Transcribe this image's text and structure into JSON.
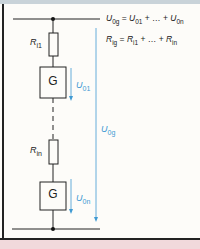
{
  "diagram": {
    "equations": {
      "voltage": {
        "lhs": "U",
        "lhs_sub": "0g",
        "t1": "U",
        "t1_sub": "01",
        "mid": " + … + ",
        "t2": "U",
        "t2_sub": "0n"
      },
      "resistance": {
        "lhs": "R",
        "lhs_sub": "ig",
        "t1": "R",
        "t1_sub": "i1",
        "mid": " + … + ",
        "t2": "R",
        "t2_sub": "in"
      }
    },
    "components": [
      {
        "type": "resistor",
        "label": "R",
        "sub": "i1"
      },
      {
        "type": "generator",
        "label": "G"
      },
      {
        "type": "resistor",
        "label": "R",
        "sub": "in"
      },
      {
        "type": "generator",
        "label": "G"
      }
    ],
    "arrows": [
      {
        "label": "U",
        "sub": "01"
      },
      {
        "label": "U",
        "sub": "0n"
      },
      {
        "label": "U",
        "sub": "0g"
      }
    ],
    "colors": {
      "wire": "#222222",
      "arrow": "#3f9ad3",
      "footer": "#f1d9dc",
      "header": "#c9d3d9"
    }
  }
}
